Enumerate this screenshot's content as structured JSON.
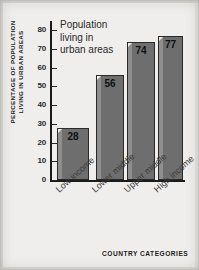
{
  "chart_data": {
    "type": "bar",
    "title": "",
    "annotation": [
      "Population",
      "living in",
      "urban areas"
    ],
    "categories": [
      "Low income",
      "Lower middle",
      "Upper middle",
      "High income"
    ],
    "values": [
      28,
      56,
      74,
      77
    ],
    "xlabel": "COUNTRY CATEGORIES",
    "ylabel_lines": [
      "PERCENTAGE OF POPULATION",
      "LIVING IN URBAN AREAS"
    ],
    "ylim": [
      0,
      85
    ],
    "yticks": [
      0,
      10,
      20,
      30,
      40,
      50,
      60,
      70,
      80
    ],
    "ytick_labels": [
      "0",
      "10",
      "20",
      "30",
      "40",
      "50",
      "60",
      "70",
      "80"
    ],
    "grid": false,
    "legend": null,
    "bar_color": "#6e6e6e",
    "bar_edge_color": "#2a2a2a",
    "bar_highlight_color": "#8e8e8e",
    "axis_color": "#1b1b1b",
    "background_color": "#efeeec",
    "value_label_color": "#101010"
  }
}
